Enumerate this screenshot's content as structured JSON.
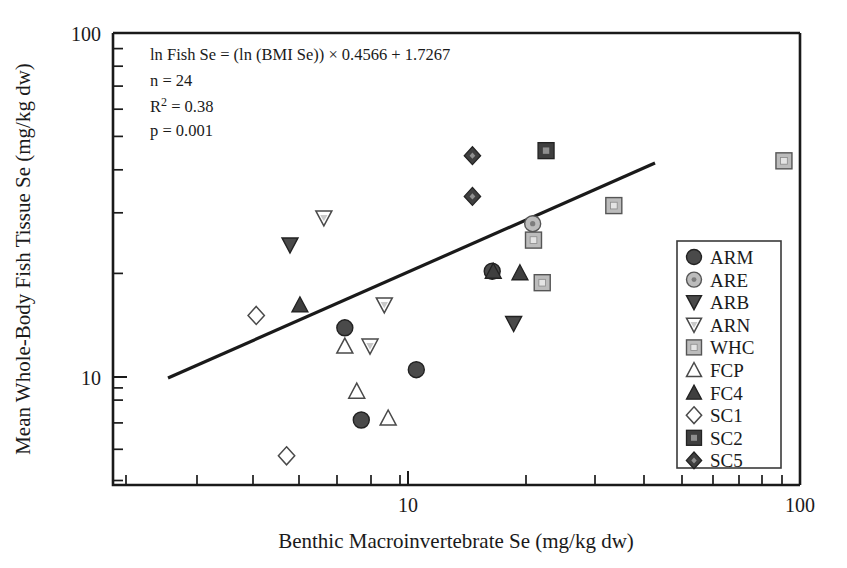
{
  "chart_data": {
    "type": "scatter",
    "title": "",
    "xlabel": "Benthic Macroinvertebrate Se (mg/kg dw)",
    "ylabel": "Mean Whole-Body Fish Tissue Se (mg/kg dw)",
    "xscale": "log",
    "yscale": "log",
    "xlim": [
      2.7,
      100
    ],
    "ylim": [
      4.6,
      100
    ],
    "xticks": [
      10,
      100
    ],
    "xtick_labels": [
      "10",
      "100"
    ],
    "yticks": [
      10,
      100
    ],
    "ytick_labels": [
      "10",
      "100"
    ],
    "grid": false,
    "legend_position": "right-middle",
    "annotations": {
      "equation": "ln Fish Se = (ln (BMI Se)) × 0.4566 + 1.7267",
      "n": "n = 24",
      "r_squared_label": "R",
      "r_squared_exp": "2",
      "r_squared_value": " = 0.38",
      "p_value": "p = 0.001"
    },
    "fit_line": {
      "label": "regression-line",
      "slope": 0.4566,
      "intercept": 1.7267,
      "x_start": 4.15,
      "x_end": 46.0,
      "y_start": 9.93,
      "y_end": 30.2
    },
    "series": [
      {
        "name": "ARM",
        "marker": "filled-circle",
        "color": "#4a4a4a",
        "points": [
          {
            "x": 6.9,
            "y": 13.9
          },
          {
            "x": 7.6,
            "y": 7.5
          },
          {
            "x": 10.5,
            "y": 10.5
          },
          {
            "x": 16.4,
            "y": 20.3
          }
        ]
      },
      {
        "name": "ARE",
        "marker": "dotted-circle",
        "color": "#bcbcbc",
        "points": [
          {
            "x": 20.8,
            "y": 27.9
          }
        ]
      },
      {
        "name": "ARB",
        "marker": "filled-down-triangle",
        "color": "#4a4a4a",
        "points": [
          {
            "x": 5.0,
            "y": 24.2
          },
          {
            "x": 18.6,
            "y": 14.3
          }
        ]
      },
      {
        "name": "ARN",
        "marker": "open-down-triangle",
        "color": "#bcbcbc",
        "points": [
          {
            "x": 6.1,
            "y": 29.0
          },
          {
            "x": 8.7,
            "y": 16.2
          },
          {
            "x": 8.0,
            "y": 12.3
          }
        ]
      },
      {
        "name": "WHC",
        "marker": "gray-square",
        "color": "#bcbcbc",
        "points": [
          {
            "x": 22.0,
            "y": 18.8
          },
          {
            "x": 20.9,
            "y": 25.0
          },
          {
            "x": 33.5,
            "y": 31.5
          },
          {
            "x": 91.0,
            "y": 42.5
          }
        ]
      },
      {
        "name": "FCP",
        "marker": "open-up-triangle",
        "color": "#ffffff",
        "points": [
          {
            "x": 6.9,
            "y": 12.3
          },
          {
            "x": 7.4,
            "y": 9.1
          },
          {
            "x": 8.9,
            "y": 7.6
          }
        ]
      },
      {
        "name": "FC4",
        "marker": "filled-up-triangle",
        "color": "#3f3f3f",
        "points": [
          {
            "x": 5.3,
            "y": 16.2
          },
          {
            "x": 16.5,
            "y": 20.3
          },
          {
            "x": 19.3,
            "y": 20.1
          }
        ]
      },
      {
        "name": "SC1",
        "marker": "open-diamond",
        "color": "#ffffff",
        "points": [
          {
            "x": 4.1,
            "y": 15.1
          },
          {
            "x": 4.9,
            "y": 5.9
          }
        ]
      },
      {
        "name": "SC2",
        "marker": "dark-square",
        "color": "#3f3f3f",
        "points": [
          {
            "x": 22.5,
            "y": 45.5
          }
        ]
      },
      {
        "name": "SC5",
        "marker": "dark-diamond",
        "color": "#3f3f3f",
        "points": [
          {
            "x": 14.6,
            "y": 44.0
          },
          {
            "x": 14.6,
            "y": 33.5
          }
        ]
      }
    ]
  },
  "legend": {
    "entries": [
      {
        "label": "ARM",
        "marker": "filled-circle"
      },
      {
        "label": "ARE",
        "marker": "dotted-circle"
      },
      {
        "label": "ARB",
        "marker": "filled-down-triangle"
      },
      {
        "label": "ARN",
        "marker": "open-down-triangle"
      },
      {
        "label": "WHC",
        "marker": "gray-square"
      },
      {
        "label": "FCP",
        "marker": "open-up-triangle"
      },
      {
        "label": "FC4",
        "marker": "filled-up-triangle"
      },
      {
        "label": "SC1",
        "marker": "open-diamond"
      },
      {
        "label": "SC2",
        "marker": "dark-square"
      },
      {
        "label": "SC5",
        "marker": "dark-diamond"
      }
    ]
  }
}
